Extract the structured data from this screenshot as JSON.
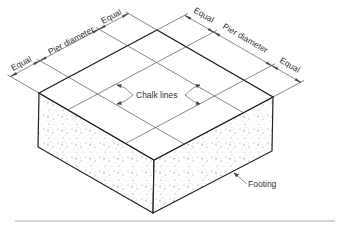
{
  "diagram": {
    "type": "isometric-footing",
    "labels": {
      "left_equal_1": "Equal",
      "left_pier": "Pier diameter",
      "left_equal_2": "Equal",
      "right_equal_1": "Equal",
      "right_pier": "Pier diameter",
      "right_equal_2": "Equal",
      "chalk_lines": "Chalk lines",
      "footing": "Footing"
    },
    "colors": {
      "outline": "#222222",
      "grid": "#555555",
      "speckle": "#888888",
      "rule": "#aaaaaa"
    }
  }
}
